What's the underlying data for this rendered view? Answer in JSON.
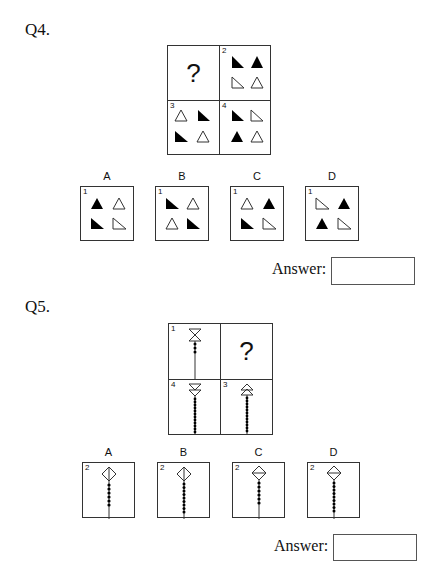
{
  "q4": {
    "label": "Q4.",
    "grid": {
      "question_mark": "?",
      "cells": [
        {
          "num": "",
          "content": "?"
        },
        {
          "num": "2"
        },
        {
          "num": "3"
        },
        {
          "num": "4"
        }
      ]
    },
    "options": [
      {
        "label": "A",
        "num": "1"
      },
      {
        "label": "B",
        "num": "1"
      },
      {
        "label": "C",
        "num": "1"
      },
      {
        "label": "D",
        "num": "1"
      }
    ],
    "answer_label": "Answer:",
    "answer_value": ""
  },
  "q5": {
    "label": "Q5.",
    "grid": {
      "question_mark": "?",
      "cells": [
        {
          "num": "1"
        },
        {
          "num": "",
          "content": "?"
        },
        {
          "num": "4"
        },
        {
          "num": "3"
        }
      ]
    },
    "options": [
      {
        "label": "A",
        "num": "2"
      },
      {
        "label": "B",
        "num": "2"
      },
      {
        "label": "C",
        "num": "2"
      },
      {
        "label": "D",
        "num": "2"
      }
    ],
    "answer_label": "Answer:",
    "answer_value": ""
  }
}
